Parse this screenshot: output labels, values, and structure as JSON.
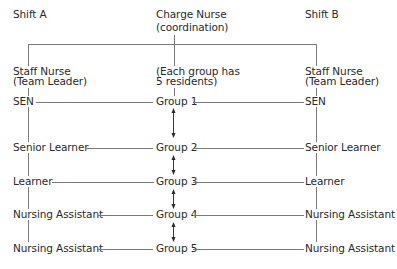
{
  "header": {
    "shift_a": "Shift A",
    "charge_nurse": "Charge Nurse",
    "charge_nurse_role": "(coordination)",
    "shift_b": "Shift B"
  },
  "team_leaders": {
    "left_title": "Staff Nurse",
    "left_role": "(Team Leader)",
    "center_note_line1": "(Each group has",
    "center_note_line2": "5 residents)",
    "right_title": "Staff Nurse",
    "right_role": "(Team Leader)"
  },
  "rows": [
    {
      "left": "SEN",
      "group": "Group 1",
      "right": "SEN"
    },
    {
      "left": "Senior Learner",
      "group": "Group 2",
      "right": "Senior Learner"
    },
    {
      "left": "Learner",
      "group": "Group 3",
      "right": "Learner"
    },
    {
      "left": "Nursing Assistant",
      "group": "Group 4",
      "right": "Nursing Assistant"
    },
    {
      "left": "Nursing Assistant",
      "group": "Group 5",
      "right": "Nursing Assistant"
    }
  ],
  "colors": {
    "text": "#2a2a2a",
    "lines": "#7a7a7a",
    "background": "#ffffff"
  }
}
